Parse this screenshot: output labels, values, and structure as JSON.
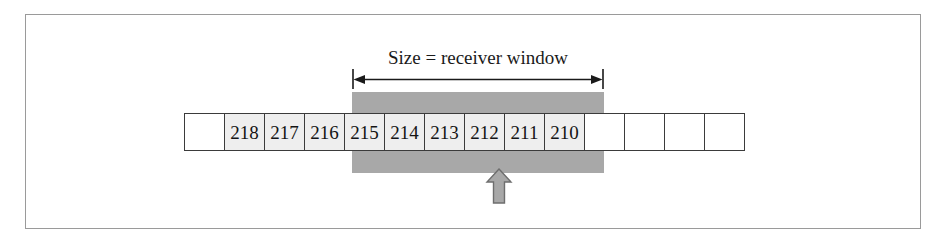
{
  "figure": {
    "title_label": "Size = receiver window",
    "colors": {
      "window_shade": "#a8a8a8",
      "cell_fill": "#eeeeee",
      "cell_border": "#3b3b3b",
      "frame_border": "#9a9a9a",
      "pointer_fill": "#a8a8a8",
      "pointer_stroke": "#6e6e6e",
      "text": "#141414"
    }
  },
  "cells": [
    {
      "label": "",
      "shaded": false,
      "empty": true
    },
    {
      "label": "218",
      "shaded": false,
      "empty": false
    },
    {
      "label": "217",
      "shaded": false,
      "empty": false
    },
    {
      "label": "216",
      "shaded": false,
      "empty": false
    },
    {
      "label": "215",
      "shaded": true,
      "empty": false
    },
    {
      "label": "214",
      "shaded": true,
      "empty": false
    },
    {
      "label": "213",
      "shaded": true,
      "empty": false
    },
    {
      "label": "212",
      "shaded": true,
      "empty": false
    },
    {
      "label": "211",
      "shaded": true,
      "empty": false
    },
    {
      "label": "210",
      "shaded": true,
      "empty": false
    },
    {
      "label": "",
      "shaded": false,
      "empty": true
    },
    {
      "label": "",
      "shaded": false,
      "empty": true
    },
    {
      "label": "",
      "shaded": false,
      "empty": true
    },
    {
      "label": "",
      "shaded": false,
      "empty": true
    }
  ],
  "pointer": {
    "points_to": "212",
    "direction": "up"
  }
}
